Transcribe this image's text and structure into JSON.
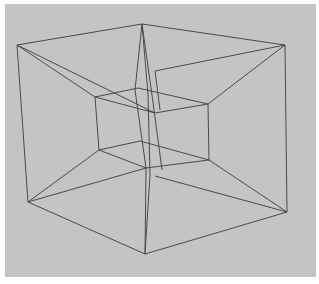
{
  "figure": {
    "background_color": "#c4c4c4",
    "border_color": "#ffffff",
    "line_color": "#4a4a4a",
    "outer_cube": {
      "vertices": {
        "top_left": [
          17,
          45
        ],
        "top_back": [
          142,
          24
        ],
        "top_right": [
          285,
          45
        ],
        "bottom_left": [
          28,
          202
        ],
        "bottom_front": [
          145,
          254
        ],
        "bottom_right": [
          287,
          212
        ]
      }
    },
    "inner_cube": {
      "vertices": {
        "top_left": [
          95,
          97
        ],
        "top_back": [
          138,
          88
        ],
        "top_right": [
          208,
          104
        ],
        "top_front": [
          155,
          113
        ],
        "bottom_left": [
          99,
          150
        ],
        "bottom_back": [
          140,
          141
        ],
        "bottom_right": [
          209,
          160
        ],
        "bottom_front": [
          146,
          168
        ]
      }
    }
  }
}
